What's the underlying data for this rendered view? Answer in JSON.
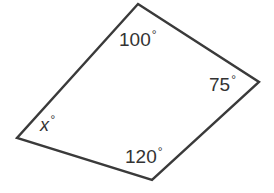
{
  "figure": {
    "name": "quadrilateral-angle-diagram",
    "background_color": "#ffffff",
    "stroke_color": "#3a3a3a",
    "stroke_width": 2.4,
    "text_color": "#333333",
    "degree_symbol": "°"
  },
  "chart_data": {
    "type": "diagram",
    "title": "",
    "shape": "quadrilateral",
    "vertices": [
      {
        "name": "top",
        "x": 138,
        "y": 4,
        "angle_label": "100",
        "angle_value": 100
      },
      {
        "name": "right",
        "x": 259,
        "y": 82,
        "angle_label": "75",
        "angle_value": 75
      },
      {
        "name": "bottom",
        "x": 152,
        "y": 180,
        "angle_label": "120",
        "angle_value": 120
      },
      {
        "name": "left",
        "x": 17,
        "y": 138,
        "angle_label": "x",
        "angle_value": null
      }
    ],
    "path": "M 138 4 L 259 82 L 152 180 L 17 138 Z",
    "annotations": [
      {
        "id": "angle-100",
        "text": "100",
        "suffix": "°",
        "x": 119,
        "y": 29,
        "italic": false
      },
      {
        "id": "angle-75",
        "text": "75",
        "suffix": "°",
        "x": 209,
        "y": 74,
        "italic": false
      },
      {
        "id": "angle-120",
        "text": "120",
        "suffix": "°",
        "x": 125,
        "y": 146,
        "italic": false
      },
      {
        "id": "angle-x",
        "text": "x",
        "suffix": "°",
        "x": 40,
        "y": 114,
        "italic": true
      }
    ],
    "xlim": [
      0,
      274
    ],
    "ylim": [
      0,
      193
    ],
    "grid": false,
    "legend": null
  },
  "labels": {
    "angle_top": "100",
    "angle_right": "75",
    "angle_bottom": "120",
    "angle_left": "x",
    "degree": "°"
  }
}
